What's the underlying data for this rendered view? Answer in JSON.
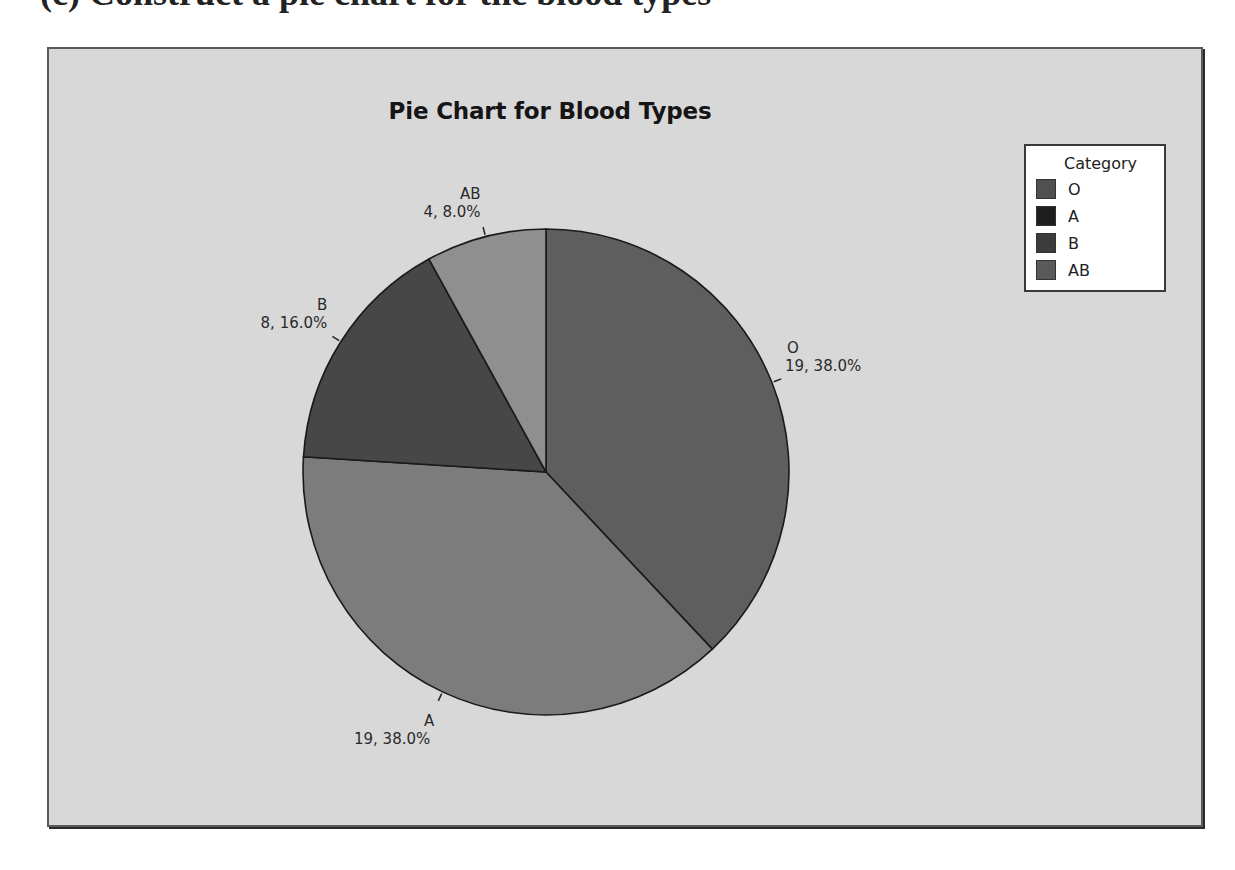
{
  "page": {
    "top_fragment_text": "(c) Construct a pie chart for the blood types"
  },
  "chart_data": {
    "type": "pie",
    "title": "Pie Chart for Blood Types",
    "categories": [
      "O",
      "A",
      "B",
      "AB"
    ],
    "values": [
      19,
      19,
      8,
      4
    ],
    "percentages": [
      38.0,
      38.0,
      16.0,
      8.0
    ],
    "total": 50,
    "start_angle_deg": 0,
    "direction": "clockwise",
    "colors": [
      "#5e5e5e",
      "#7c7c7c",
      "#474747",
      "#8f8f8f"
    ],
    "slice_labels": [
      {
        "category": "O",
        "text": "19, 38.0%"
      },
      {
        "category": "A",
        "text": "19, 38.0%"
      },
      {
        "category": "B",
        "text": "8, 16.0%"
      },
      {
        "category": "AB",
        "text": "4, 8.0%"
      }
    ],
    "legend": {
      "title": "Category",
      "position": "top-right",
      "items": [
        {
          "label": "O",
          "color": "#505050"
        },
        {
          "label": "A",
          "color": "#1e1e1e"
        },
        {
          "label": "B",
          "color": "#3c3c3c"
        },
        {
          "label": "AB",
          "color": "#5a5a5a"
        }
      ]
    },
    "background": "#d8d8d8",
    "grid": false
  }
}
